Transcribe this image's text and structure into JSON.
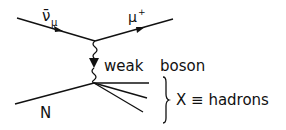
{
  "diagram": {
    "type": "feynman",
    "incoming_antineutrino": {
      "label": "ν̄",
      "subscript": "μ"
    },
    "outgoing_muon": {
      "label": "μ",
      "superscript": "+"
    },
    "boson": {
      "label_1": "weak",
      "label_2": "boson"
    },
    "nucleon": {
      "label": "N"
    },
    "hadrons": {
      "label": "X ≡ hadrons"
    },
    "colors": {
      "line": "#111111",
      "background": "#ffffff"
    }
  }
}
